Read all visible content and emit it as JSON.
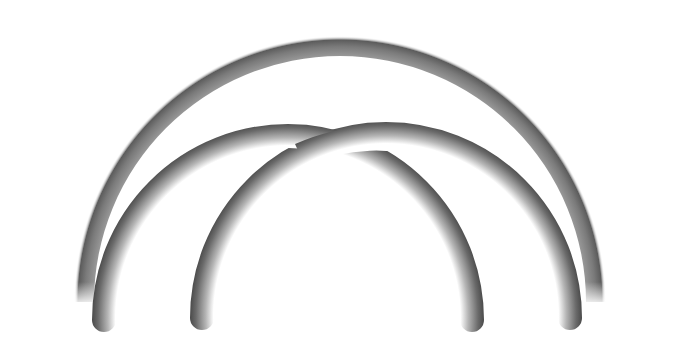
{
  "scene": {
    "background": "#ffffff",
    "shapes": [
      {
        "name": "large-arc",
        "cx": 340,
        "cy": 302,
        "r_outer": 266,
        "r_inner": 214,
        "color_dark": "#555555",
        "color_light": "#ffffff"
      },
      {
        "name": "left-small-arc",
        "cx": 288,
        "cy": 318,
        "r": 184,
        "width": 22,
        "color_dark": "#444444",
        "color_light": "#ffffff"
      },
      {
        "name": "right-small-arc",
        "cx": 386,
        "cy": 316,
        "r": 184,
        "width": 22,
        "color_dark": "#444444",
        "color_light": "#ffffff"
      }
    ]
  }
}
